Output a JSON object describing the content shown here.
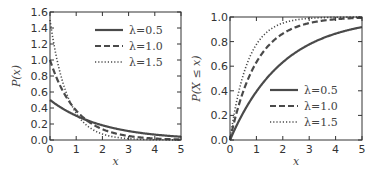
{
  "chart_data": [
    {
      "type": "line",
      "title": "",
      "xlabel": "x",
      "ylabel": "P(x)",
      "xlim": [
        0,
        5
      ],
      "ylim": [
        0,
        1.6
      ],
      "xticks": [
        "0",
        "1",
        "2",
        "3",
        "4",
        "5"
      ],
      "yticks": [
        "0.0",
        "0.2",
        "0.4",
        "0.6",
        "0.8",
        "1.0",
        "1.2",
        "1.4",
        "1.6"
      ],
      "legend_position": "upper right",
      "function": "lambda * exp(-lambda * x)",
      "series": [
        {
          "name": "λ=0.5",
          "lambda": 0.5,
          "style": "solid",
          "x": [
            0,
            0.5,
            1,
            1.5,
            2,
            2.5,
            3,
            3.5,
            4,
            4.5,
            5
          ],
          "values": [
            0.5,
            0.389,
            0.303,
            0.236,
            0.184,
            0.143,
            0.112,
            0.087,
            0.068,
            0.053,
            0.041
          ]
        },
        {
          "name": "λ=1.0",
          "lambda": 1.0,
          "style": "dashed",
          "x": [
            0,
            0.5,
            1,
            1.5,
            2,
            2.5,
            3,
            3.5,
            4,
            4.5,
            5
          ],
          "values": [
            1.0,
            0.607,
            0.368,
            0.223,
            0.135,
            0.082,
            0.05,
            0.03,
            0.018,
            0.011,
            0.007
          ]
        },
        {
          "name": "λ=1.5",
          "lambda": 1.5,
          "style": "dotted",
          "x": [
            0,
            0.5,
            1,
            1.5,
            2,
            2.5,
            3,
            3.5,
            4,
            4.5,
            5
          ],
          "values": [
            1.5,
            0.709,
            0.335,
            0.158,
            0.075,
            0.035,
            0.017,
            0.008,
            0.004,
            0.002,
            0.001
          ]
        }
      ]
    },
    {
      "type": "line",
      "title": "",
      "xlabel": "x",
      "ylabel": "P(X ≤ x)",
      "xlim": [
        0,
        5
      ],
      "ylim": [
        0,
        1.0
      ],
      "xticks": [
        "0",
        "1",
        "2",
        "3",
        "4",
        "5"
      ],
      "yticks": [
        "0.0",
        "0.2",
        "0.4",
        "0.6",
        "0.8",
        "1.0"
      ],
      "legend_position": "lower right",
      "function": "1 - exp(-lambda * x)",
      "series": [
        {
          "name": "λ=0.5",
          "lambda": 0.5,
          "style": "solid",
          "x": [
            0,
            0.5,
            1,
            1.5,
            2,
            2.5,
            3,
            3.5,
            4,
            4.5,
            5
          ],
          "values": [
            0,
            0.221,
            0.393,
            0.528,
            0.632,
            0.713,
            0.777,
            0.826,
            0.865,
            0.895,
            0.918
          ]
        },
        {
          "name": "λ=1.0",
          "lambda": 1.0,
          "style": "dashed",
          "x": [
            0,
            0.5,
            1,
            1.5,
            2,
            2.5,
            3,
            3.5,
            4,
            4.5,
            5
          ],
          "values": [
            0,
            0.393,
            0.632,
            0.777,
            0.865,
            0.918,
            0.95,
            0.97,
            0.982,
            0.989,
            0.993
          ]
        },
        {
          "name": "λ=1.5",
          "lambda": 1.5,
          "style": "dotted",
          "x": [
            0,
            0.5,
            1,
            1.5,
            2,
            2.5,
            3,
            3.5,
            4,
            4.5,
            5
          ],
          "values": [
            0,
            0.528,
            0.777,
            0.895,
            0.95,
            0.976,
            0.989,
            0.995,
            0.998,
            0.999,
            0.999
          ]
        }
      ]
    }
  ],
  "colors": {
    "line": "#4a4a4a",
    "axis": "#333333",
    "text": "#333333"
  }
}
